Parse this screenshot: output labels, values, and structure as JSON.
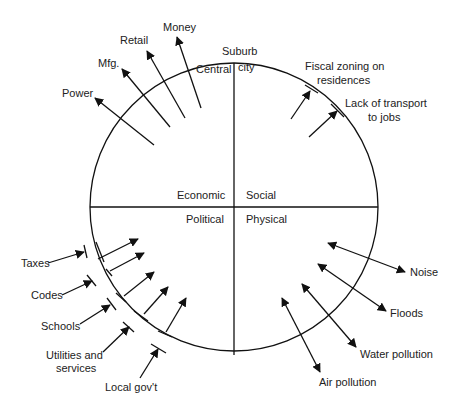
{
  "diagram": {
    "rings": {
      "outer": "Suburb",
      "inner_a": "Central",
      "inner_b": "city"
    },
    "quadrants": {
      "top_left": "Economic",
      "top_right": "Social",
      "bottom_left": "Political",
      "bottom_right": "Physical"
    },
    "economic_outflows": [
      "Power",
      "Mfg.",
      "Retail",
      "Money"
    ],
    "social_inflows": {
      "a1": "Fiscal zoning on",
      "a2": "residences",
      "b1": "Lack of transport",
      "b2": "to jobs"
    },
    "political_items": {
      "taxes": "Taxes",
      "codes": "Codes",
      "schools": "Schools",
      "util1": "Utilities and",
      "util2": "services",
      "local": "Local gov't"
    },
    "physical_items": [
      "Noise",
      "Floods",
      "Water pollution",
      "Air pollution"
    ]
  }
}
